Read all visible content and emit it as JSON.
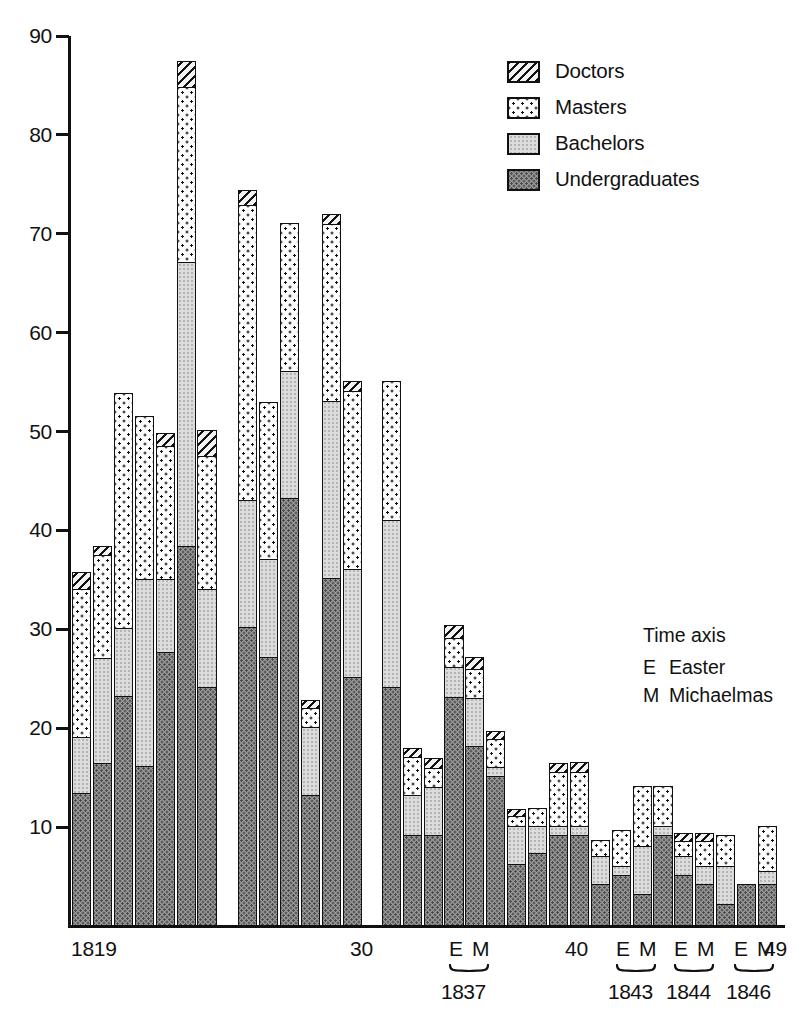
{
  "chart_data": {
    "type": "bar",
    "subtype": "stacked-bar",
    "title": "",
    "xlabel": "Time axis",
    "ylabel": "",
    "ylim": [
      0,
      90
    ],
    "ytick_values": [
      10,
      20,
      30,
      40,
      50,
      60,
      70,
      80,
      90
    ],
    "ytick_labels": [
      "10",
      "20",
      "30",
      "40",
      "50",
      "60",
      "70",
      "80",
      "90"
    ],
    "grid": false,
    "legend_position": "top-right",
    "series": [
      {
        "name": "Undergraduates",
        "fill": "undergraduates",
        "values": [
          13.4,
          16.4,
          23.2,
          16.1,
          27.6,
          38.3,
          24.1,
          30.1,
          27.1,
          43.2,
          13.1,
          35.1,
          25.1,
          24.1,
          9.1,
          9.1,
          23.1,
          18.1,
          15.1,
          6.2,
          7.3,
          9.1,
          9.1,
          4.1,
          5.1,
          3.1,
          9.1,
          5.1,
          4.1,
          2.1,
          4.1,
          4.1
        ]
      },
      {
        "name": "Bachelors",
        "fill": "bachelors",
        "values": [
          5.6,
          10.6,
          6.8,
          18.9,
          7.4,
          28.7,
          9.9,
          12.9,
          9.9,
          12.8,
          6.9,
          17.9,
          10.9,
          16.9,
          4.0,
          4.9,
          3.0,
          4.9,
          0.9,
          3.8,
          2.7,
          0.9,
          0.9,
          2.9,
          0.9,
          4.9,
          0.9,
          1.9,
          1.9,
          3.9,
          0.0,
          1.4
        ]
      },
      {
        "name": "Masters",
        "fill": "masters",
        "values": [
          15.0,
          10.4,
          23.7,
          16.4,
          13.4,
          17.7,
          13.4,
          29.8,
          15.8,
          14.9,
          1.9,
          17.9,
          18.0,
          14.0,
          3.9,
          1.9,
          2.9,
          2.9,
          2.8,
          1.0,
          1.8,
          5.5,
          5.5,
          1.5,
          3.5,
          6.0,
          4.0,
          1.5,
          2.5,
          3.0,
          0.0,
          4.5
        ]
      },
      {
        "name": "Doctors",
        "fill": "doctors",
        "values": [
          1.6,
          0.9,
          0.0,
          0.0,
          1.3,
          2.6,
          2.6,
          1.5,
          0.0,
          0.0,
          0.8,
          0.9,
          1.0,
          0.0,
          0.8,
          0.9,
          1.3,
          1.1,
          0.8,
          0.7,
          0.0,
          0.8,
          0.9,
          0.0,
          0.0,
          0.0,
          0.0,
          0.7,
          0.7,
          0.0,
          0.0,
          0.0
        ]
      }
    ],
    "totals": [
      35.6,
      38.3,
      53.7,
      51.4,
      49.7,
      87.3,
      50.0,
      74.3,
      52.8,
      70.9,
      22.7,
      71.8,
      55.0,
      55.0,
      17.8,
      16.8,
      30.3,
      27.0,
      19.6,
      11.7,
      11.8,
      16.3,
      16.4,
      8.5,
      9.5,
      14.0,
      14.0,
      9.2,
      9.2,
      9.0,
      4.1,
      10.0
    ],
    "annotations": {
      "time_axis_title": "Time axis",
      "keys": [
        {
          "key": "E",
          "meaning": "Easter"
        },
        {
          "key": "M",
          "meaning": "Michaelmas"
        }
      ]
    }
  },
  "legend": {
    "items": [
      {
        "label": "Doctors",
        "fill": "doctors"
      },
      {
        "label": "Masters",
        "fill": "masters"
      },
      {
        "label": "Bachelors",
        "fill": "bachelors"
      },
      {
        "label": "Undergraduates",
        "fill": "undergraduates"
      }
    ]
  },
  "x_axis": {
    "plain_labels": [
      {
        "text": "1819",
        "x": 0
      },
      {
        "text": "30",
        "x": 279
      },
      {
        "text": "40",
        "x": 494
      },
      {
        "text": "49",
        "x": 693
      }
    ],
    "term_groups": [
      {
        "easter": "E",
        "michaelmas": "M",
        "year": "1837",
        "x": 378
      },
      {
        "easter": "E",
        "michaelmas": "M",
        "year": "1843",
        "x": 545
      },
      {
        "easter": "E",
        "michaelmas": "M",
        "year": "1844",
        "x": 603
      },
      {
        "easter": "E",
        "michaelmas": "M",
        "year": "1846",
        "x": 663
      }
    ]
  },
  "colors": {
    "ink": "#111111",
    "paper": "#ffffff",
    "undergraduates": "#9a9a9a",
    "bachelors": "#dcdcdc",
    "masters": "#fdfdfd",
    "doctors": "#f2f2f2"
  }
}
